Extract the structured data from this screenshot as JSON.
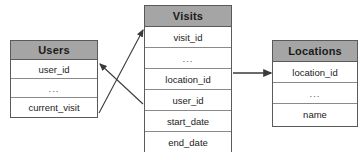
{
  "diagram": {
    "type": "entity-relationship-diagram",
    "background_color": "#ffffff",
    "header_color": "#a5a5a5",
    "row_color": "#ffffff",
    "border_color": "#5a5a5a",
    "line_color": "#3a3a3a"
  },
  "tables": {
    "users": {
      "title": "Users",
      "columns": [
        "user_id",
        "...",
        "current_visit"
      ]
    },
    "visits": {
      "title": "Visits",
      "columns": [
        "visit_id",
        "...",
        "location_id",
        "user_id",
        "start_date",
        "end_date"
      ]
    },
    "locations": {
      "title": "Locations",
      "columns": [
        "location_id",
        "...",
        "name"
      ]
    }
  },
  "relationships": [
    {
      "name": "users-current-visit-to-visits",
      "from_table": "Users",
      "from_column": "current_visit",
      "to_table": "Visits",
      "to_column": "visit_id",
      "direction": "to-visits"
    },
    {
      "name": "visits-user-id-to-users",
      "from_table": "Visits",
      "from_column": "user_id",
      "to_table": "Users",
      "to_column": "user_id",
      "direction": "to-users"
    },
    {
      "name": "visits-location-id-to-locations",
      "from_table": "Visits",
      "from_column": "location_id",
      "to_table": "Locations",
      "to_column": "location_id",
      "direction": "to-locations"
    }
  ]
}
